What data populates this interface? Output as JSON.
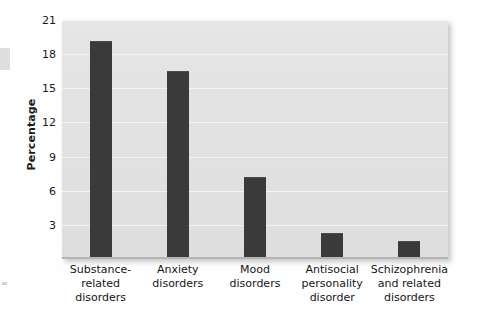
{
  "chart_data": {
    "type": "bar",
    "title": "",
    "xlabel": "",
    "ylabel": "Percentage",
    "ylim": [
      0,
      21
    ],
    "yticks": [
      3,
      6,
      9,
      12,
      15,
      18,
      21
    ],
    "grid": true,
    "legend": false,
    "bar_color": "#3a3a3a",
    "plot_background": "#e3e3e3",
    "categories": [
      "Substance-related disorders",
      "Anxiety disorders",
      "Mood disorders",
      "Antisocial personality disorder",
      "Schizophrenia and related disorders"
    ],
    "category_lines": [
      [
        "Substance-",
        "related",
        "disorders"
      ],
      [
        "Anxiety",
        "disorders"
      ],
      [
        "Mood",
        "disorders"
      ],
      [
        "Antisocial",
        "personality",
        "disorder"
      ],
      [
        "Schizophrenia",
        "and related",
        "disorders"
      ]
    ],
    "values": [
      19.1,
      16.4,
      7.1,
      2.2,
      1.5
    ]
  }
}
